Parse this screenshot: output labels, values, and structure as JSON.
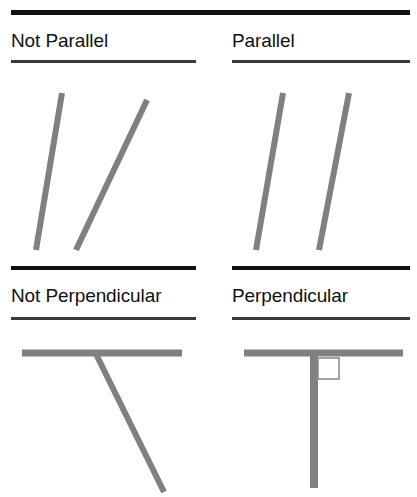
{
  "figure": {
    "background_color": "#ffffff",
    "line_color": "#808080",
    "rule_color_heavy": "#101010",
    "rule_color_thin": "#3a3a3a",
    "text_color": "#111111",
    "width": 417,
    "height": 497
  },
  "panels": [
    {
      "id": "not-parallel",
      "heading": "Not Parallel",
      "position": "top-left",
      "concept": "parallel",
      "is_example": false,
      "segments": [
        {
          "name": "segment-a",
          "x1": 62,
          "y1": 93,
          "x2": 36,
          "y2": 250
        },
        {
          "name": "segment-b",
          "x1": 147,
          "y1": 100,
          "x2": 76,
          "y2": 250
        }
      ],
      "right_angle_marker": false
    },
    {
      "id": "parallel",
      "heading": "Parallel",
      "position": "top-right",
      "concept": "parallel",
      "is_example": true,
      "segments": [
        {
          "name": "segment-a",
          "x1": 283,
          "y1": 93,
          "x2": 256,
          "y2": 250
        },
        {
          "name": "segment-b",
          "x1": 349,
          "y1": 93,
          "x2": 319,
          "y2": 250
        }
      ],
      "right_angle_marker": false
    },
    {
      "id": "not-perpendicular",
      "heading": "Not Perpendicular",
      "position": "bottom-left",
      "concept": "perpendicular",
      "is_example": false,
      "segments": [
        {
          "name": "segment-horizontal",
          "x1": 22,
          "y1": 353,
          "x2": 182,
          "y2": 353
        },
        {
          "name": "segment-oblique",
          "x1": 96,
          "y1": 354,
          "x2": 164,
          "y2": 492
        }
      ],
      "right_angle_marker": false
    },
    {
      "id": "perpendicular",
      "heading": "Perpendicular",
      "position": "bottom-right",
      "concept": "perpendicular",
      "is_example": true,
      "segments": [
        {
          "name": "segment-horizontal",
          "x1": 244,
          "y1": 353,
          "x2": 403,
          "y2": 353
        },
        {
          "name": "segment-vertical",
          "x1": 314,
          "y1": 354,
          "x2": 314,
          "y2": 488
        }
      ],
      "right_angle_marker": true,
      "right_angle_square": {
        "x": 318,
        "y": 358,
        "size": 21
      }
    }
  ]
}
